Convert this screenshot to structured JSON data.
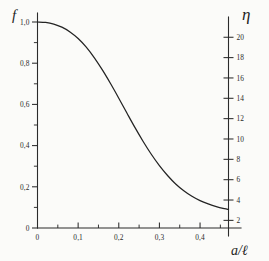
{
  "figure": {
    "background_color": "#fbfbf9",
    "ink_color": "#232323"
  },
  "chart_data": {
    "type": "line",
    "title": "",
    "subtitle": "",
    "xlabel": "a/ℓ",
    "ylabel": "f",
    "y2label": "η",
    "xlim": [
      0,
      0.47
    ],
    "ylim": [
      0,
      1.0
    ],
    "y2lim": [
      1.25,
      21.5
    ],
    "grid": false,
    "legend": null,
    "x_ticks": [
      0,
      0.1,
      0.2,
      0.3,
      0.4
    ],
    "x_tick_labels": [
      "0",
      "0,1",
      "0,2",
      "0,3",
      "0,4"
    ],
    "x_minor_ticks": [
      0.05,
      0.15,
      0.25,
      0.35,
      0.45
    ],
    "y_ticks": [
      0,
      0.2,
      0.4,
      0.6,
      0.8,
      1.0
    ],
    "y_tick_labels": [
      "0",
      "0,2",
      "0,4",
      "0,6",
      "0,8",
      "1,0"
    ],
    "y_minor_ticks": [
      0.1,
      0.3,
      0.5,
      0.7,
      0.9
    ],
    "y2_ticks": [
      2,
      4,
      6,
      8,
      10,
      12,
      14,
      16,
      18,
      20
    ],
    "y2_tick_labels": [
      "2",
      "4",
      "6",
      "8",
      "10",
      "12",
      "14",
      "16",
      "18",
      "20"
    ],
    "series": [
      {
        "name": "f",
        "axis": "left",
        "x": [
          0.0,
          0.02,
          0.04,
          0.06,
          0.08,
          0.1,
          0.12,
          0.14,
          0.16,
          0.18,
          0.2,
          0.22,
          0.24,
          0.26,
          0.28,
          0.3,
          0.32,
          0.34,
          0.36,
          0.38,
          0.4,
          0.42,
          0.44,
          0.46,
          0.47
        ],
        "values": [
          1.0,
          0.998,
          0.99,
          0.975,
          0.952,
          0.92,
          0.878,
          0.826,
          0.766,
          0.7,
          0.63,
          0.558,
          0.487,
          0.42,
          0.358,
          0.303,
          0.255,
          0.214,
          0.181,
          0.154,
          0.133,
          0.117,
          0.104,
          0.094,
          0.09
        ]
      }
    ]
  }
}
